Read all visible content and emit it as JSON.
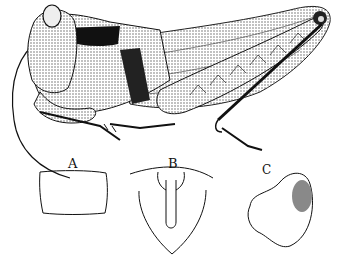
{
  "figure": {
    "labels": {
      "a": "A",
      "b": "B",
      "c": "C"
    },
    "colors": {
      "ink": "#111111",
      "stipple": "#555555",
      "paper": "#ffffff"
    }
  }
}
